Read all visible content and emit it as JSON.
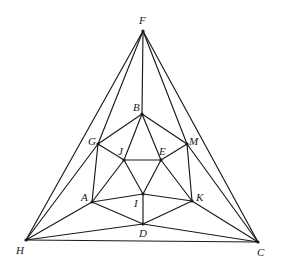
{
  "diagram": {
    "type": "planar-graph",
    "line_color": "#1a1a1a",
    "background": "#ffffff",
    "vertices": [
      {
        "id": "F",
        "x": 143,
        "y": 31,
        "label": "F",
        "lx": 139,
        "ly": 24
      },
      {
        "id": "B",
        "x": 142,
        "y": 114,
        "label": "B",
        "lx": 133,
        "ly": 111
      },
      {
        "id": "G",
        "x": 98,
        "y": 144,
        "label": "G",
        "lx": 88,
        "ly": 145
      },
      {
        "id": "M",
        "x": 187,
        "y": 144,
        "label": "M",
        "lx": 189,
        "ly": 145
      },
      {
        "id": "J",
        "x": 124,
        "y": 160,
        "label": "J",
        "lx": 118,
        "ly": 155
      },
      {
        "id": "E",
        "x": 161,
        "y": 160,
        "label": "E",
        "lx": 159,
        "ly": 155
      },
      {
        "id": "A",
        "x": 92,
        "y": 202,
        "label": "A",
        "lx": 81,
        "ly": 201
      },
      {
        "id": "I",
        "x": 143,
        "y": 194,
        "label": "I",
        "lx": 134,
        "ly": 207
      },
      {
        "id": "K",
        "x": 192,
        "y": 201,
        "label": "K",
        "lx": 196,
        "ly": 201
      },
      {
        "id": "D",
        "x": 143,
        "y": 224,
        "label": "D",
        "lx": 139,
        "ly": 237
      },
      {
        "id": "H",
        "x": 26,
        "y": 240,
        "label": "H",
        "lx": 16,
        "ly": 254
      },
      {
        "id": "C",
        "x": 258,
        "y": 242,
        "label": "C",
        "lx": 257,
        "ly": 256
      }
    ],
    "edges": [
      [
        "F",
        "H"
      ],
      [
        "F",
        "C"
      ],
      [
        "H",
        "C"
      ],
      [
        "F",
        "G"
      ],
      [
        "F",
        "B"
      ],
      [
        "F",
        "M"
      ],
      [
        "H",
        "G"
      ],
      [
        "H",
        "A"
      ],
      [
        "H",
        "D"
      ],
      [
        "C",
        "M"
      ],
      [
        "C",
        "K"
      ],
      [
        "C",
        "D"
      ],
      [
        "B",
        "G"
      ],
      [
        "B",
        "M"
      ],
      [
        "B",
        "J"
      ],
      [
        "B",
        "E"
      ],
      [
        "G",
        "J"
      ],
      [
        "G",
        "A"
      ],
      [
        "M",
        "E"
      ],
      [
        "M",
        "K"
      ],
      [
        "J",
        "E"
      ],
      [
        "J",
        "A"
      ],
      [
        "J",
        "I"
      ],
      [
        "E",
        "I"
      ],
      [
        "E",
        "K"
      ],
      [
        "A",
        "I"
      ],
      [
        "A",
        "D"
      ],
      [
        "K",
        "I"
      ],
      [
        "K",
        "D"
      ],
      [
        "I",
        "D"
      ]
    ]
  }
}
